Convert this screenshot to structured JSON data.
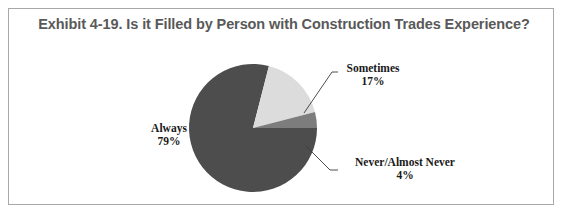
{
  "figure": {
    "title": "Exhibit 4-19.  Is it Filled by Person with Construction Trades Experience?",
    "border_color": "#a8a8a8",
    "background": "#ffffff",
    "title_color": "#595959"
  },
  "chart_data": {
    "type": "pie",
    "title": "Exhibit 4-19.  Is it Filled by Person with Construction Trades Experience?",
    "categories": [
      "Always",
      "Sometimes",
      "Never/Almost Never"
    ],
    "values": [
      79,
      17,
      4
    ],
    "value_labels": [
      "79%",
      "17%",
      "4%"
    ],
    "colors": [
      "#4d4d4d",
      "#dcdcdc",
      "#7d7d7d"
    ],
    "units": "percent",
    "legend": "none",
    "labels_position": "outside-with-leader-lines",
    "grid": false,
    "slices": [
      {
        "name": "Always",
        "value": 79,
        "value_label": "79%",
        "color": "#4d4d4d"
      },
      {
        "name": "Sometimes",
        "value": 17,
        "value_label": "17%",
        "color": "#dcdcdc"
      },
      {
        "name": "Never/Almost Never",
        "value": 4,
        "value_label": "4%",
        "color": "#7d7d7d"
      }
    ]
  },
  "labels": {
    "always": {
      "name": "Always",
      "percent": "79%"
    },
    "sometimes": {
      "name": "Sometimes",
      "percent": "17%"
    },
    "never": {
      "name": "Never/Almost Never",
      "percent": "4%"
    }
  }
}
